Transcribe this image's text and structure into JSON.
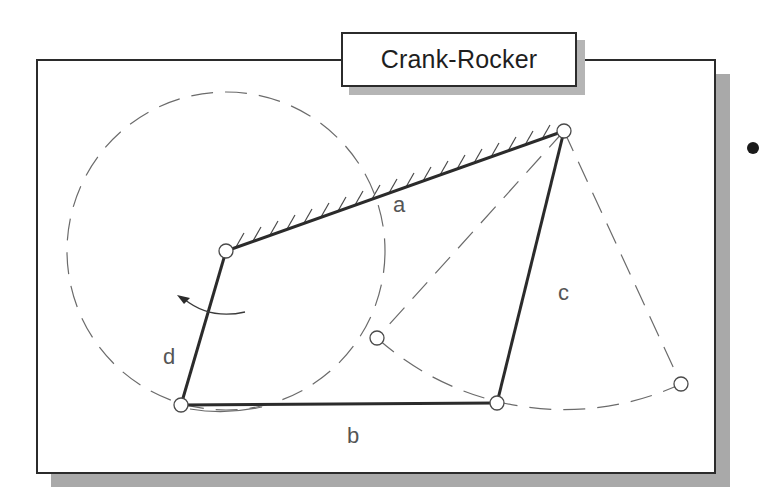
{
  "title": "Crank-Rocker",
  "labels": {
    "a": "a",
    "b": "b",
    "c": "c",
    "d": "d"
  },
  "colors": {
    "link": "#2b2b2b",
    "construction": "#6b6b6b",
    "shadow": "#a9a9a9",
    "frame": "#2b2b2b"
  },
  "diagram": {
    "pivots": {
      "A_crank_ground": [
        226,
        251
      ],
      "B_crank_coupler": [
        181,
        405
      ],
      "C_coupler_rocker": [
        497,
        403
      ],
      "D_rocker_ground": [
        564,
        131
      ],
      "rocker_extreme_left": [
        377,
        338
      ],
      "rocker_extreme_right": [
        681,
        384
      ]
    },
    "links": [
      {
        "name": "a",
        "role": "ground",
        "from": "A",
        "to": "D"
      },
      {
        "name": "b",
        "role": "coupler",
        "from": "B",
        "to": "C"
      },
      {
        "name": "c",
        "role": "rocker",
        "from": "C",
        "to": "D"
      },
      {
        "name": "d",
        "role": "crank",
        "from": "A",
        "to": "B"
      }
    ],
    "crank_circle": {
      "center": "A",
      "radius": 159,
      "style": "dashed"
    },
    "rocker_arc": {
      "center": "D",
      "radius": 280,
      "style": "dashed"
    },
    "rotation_arrow": "counter-clockwise"
  }
}
